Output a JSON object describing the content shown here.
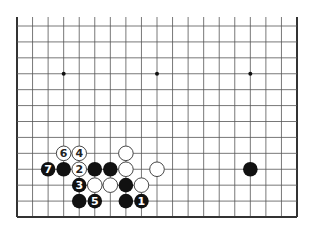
{
  "diagram": {
    "type": "go-board-partial",
    "board_size": 19,
    "visible_columns": 19,
    "visible_rows": 13,
    "edges_shown": [
      "left",
      "right",
      "bottom"
    ],
    "colors": {
      "background": "#ffffff",
      "line": "#555555",
      "edge": "#333333",
      "black_stone": "#111111",
      "white_stone": "#ffffff",
      "black_label": "#ffffff",
      "white_label": "#222222"
    },
    "star_points": [
      {
        "col": 3,
        "row": 3
      },
      {
        "col": 9,
        "row": 3
      },
      {
        "col": 15,
        "row": 3
      }
    ],
    "stones": [
      {
        "color": "white",
        "col": 3,
        "row": 8,
        "label": "6"
      },
      {
        "color": "white",
        "col": 4,
        "row": 8,
        "label": "4"
      },
      {
        "color": "white",
        "col": 7,
        "row": 8,
        "label": ""
      },
      {
        "color": "black",
        "col": 2,
        "row": 9,
        "label": "7"
      },
      {
        "color": "black",
        "col": 3,
        "row": 9,
        "label": ""
      },
      {
        "color": "white",
        "col": 4,
        "row": 9,
        "label": "2"
      },
      {
        "color": "black",
        "col": 5,
        "row": 9,
        "label": ""
      },
      {
        "color": "black",
        "col": 6,
        "row": 9,
        "label": ""
      },
      {
        "color": "white",
        "col": 7,
        "row": 9,
        "label": ""
      },
      {
        "color": "white",
        "col": 9,
        "row": 9,
        "label": ""
      },
      {
        "color": "black",
        "col": 15,
        "row": 9,
        "label": ""
      },
      {
        "color": "black",
        "col": 4,
        "row": 10,
        "label": "3"
      },
      {
        "color": "white",
        "col": 5,
        "row": 10,
        "label": ""
      },
      {
        "color": "white",
        "col": 6,
        "row": 10,
        "label": ""
      },
      {
        "color": "black",
        "col": 7,
        "row": 10,
        "label": ""
      },
      {
        "color": "white",
        "col": 8,
        "row": 10,
        "label": ""
      },
      {
        "color": "black",
        "col": 4,
        "row": 11,
        "label": ""
      },
      {
        "color": "black",
        "col": 5,
        "row": 11,
        "label": "5"
      },
      {
        "color": "black",
        "col": 7,
        "row": 11,
        "label": ""
      },
      {
        "color": "black",
        "col": 8,
        "row": 11,
        "label": "1"
      }
    ]
  }
}
